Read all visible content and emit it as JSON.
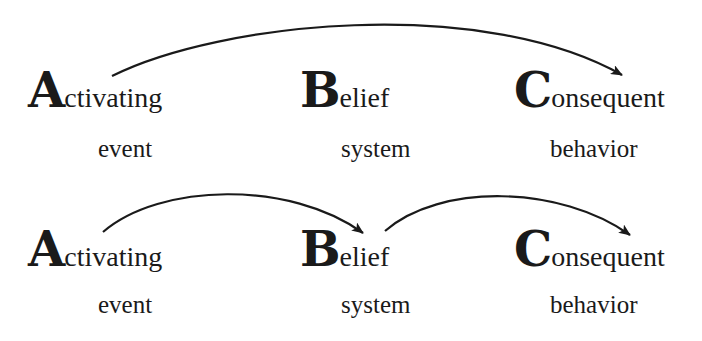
{
  "rows": [
    {
      "model": "A-C",
      "nodes": [
        {
          "initial": "A",
          "rest": "ctivating",
          "subtitle": "event"
        },
        {
          "initial": "B",
          "rest": "elief",
          "subtitle": "system"
        },
        {
          "initial": "C",
          "rest": "onsequent",
          "subtitle": "behavior"
        }
      ],
      "arrows": [
        {
          "from": "Activating",
          "to": "Consequent"
        }
      ]
    },
    {
      "model": "A-B-C",
      "nodes": [
        {
          "initial": "A",
          "rest": "ctivating",
          "subtitle": "event"
        },
        {
          "initial": "B",
          "rest": "elief",
          "subtitle": "system"
        },
        {
          "initial": "C",
          "rest": "onsequent",
          "subtitle": "behavior"
        }
      ],
      "arrows": [
        {
          "from": "Activating",
          "to": "Belief"
        },
        {
          "from": "Belief",
          "to": "Consequent"
        }
      ]
    }
  ],
  "colors": {
    "ink": "#1a1a1a",
    "background": "#ffffff"
  }
}
